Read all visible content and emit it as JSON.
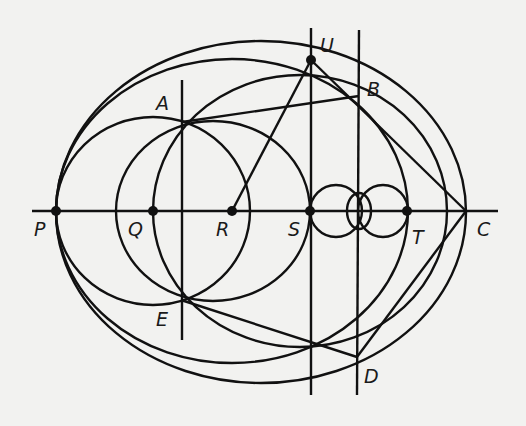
{
  "diagram": {
    "stroke_color": "#111111",
    "background": "#f2f2f0",
    "points": [
      {
        "id": "P",
        "label": "P",
        "x": 56,
        "y": 211,
        "lx": 34,
        "ly": 236,
        "dot": true
      },
      {
        "id": "Q",
        "label": "Q",
        "x": 153,
        "y": 211,
        "lx": 128,
        "ly": 236,
        "dot": true
      },
      {
        "id": "R",
        "label": "R",
        "x": 232,
        "y": 211,
        "lx": 216,
        "ly": 236,
        "dot": true
      },
      {
        "id": "S",
        "label": "S",
        "x": 310,
        "y": 211,
        "lx": 288,
        "ly": 236,
        "dot": true
      },
      {
        "id": "T",
        "label": "T",
        "x": 407,
        "y": 211,
        "lx": 412,
        "ly": 244,
        "dot": true
      },
      {
        "id": "C",
        "label": "C",
        "x": 466,
        "y": 211,
        "lx": 477,
        "ly": 236,
        "dot": false
      },
      {
        "id": "A",
        "label": "A",
        "x": 182,
        "y": 122,
        "lx": 156,
        "ly": 110,
        "dot": false
      },
      {
        "id": "E",
        "label": "E",
        "x": 181,
        "y": 300,
        "lx": 156,
        "ly": 326,
        "dot": false
      },
      {
        "id": "U",
        "label": "U",
        "x": 311,
        "y": 60,
        "lx": 320,
        "ly": 52,
        "dot": true
      },
      {
        "id": "B",
        "label": "B",
        "x": 359,
        "y": 96,
        "lx": 367,
        "ly": 96,
        "dot": false
      },
      {
        "id": "D",
        "label": "D",
        "x": 357,
        "y": 357,
        "lx": 364,
        "ly": 383,
        "dot": false
      }
    ],
    "circles": [
      {
        "name": "outer-circle",
        "cx": 261,
        "cy": 212,
        "rx": 205,
        "ry": 171
      },
      {
        "name": "circle-center-r",
        "cx": 232,
        "cy": 211,
        "rx": 176,
        "ry": 152
      },
      {
        "name": "circle-center-q",
        "cx": 153,
        "cy": 211,
        "rx": 97,
        "ry": 94
      },
      {
        "name": "circle-through-a-e-s",
        "cx": 213,
        "cy": 211,
        "rx": 97,
        "ry": 90
      },
      {
        "name": "circle-through-q-a-b",
        "cx": 300,
        "cy": 211,
        "rx": 147,
        "ry": 136
      },
      {
        "name": "small-circle-left",
        "cx": 336,
        "cy": 211,
        "rx": 26,
        "ry": 26
      },
      {
        "name": "small-circle-right",
        "cx": 383,
        "cy": 211,
        "rx": 25,
        "ry": 26
      },
      {
        "name": "small-ellipse-center",
        "cx": 359,
        "cy": 211,
        "rx": 12,
        "ry": 18
      }
    ],
    "lines": [
      {
        "name": "axis-line",
        "x1": 32,
        "y1": 211,
        "x2": 498,
        "y2": 211
      },
      {
        "name": "vertical-line-a-e",
        "x1": 182,
        "y1": 80,
        "x2": 182,
        "y2": 340
      },
      {
        "name": "vertical-line-s-u",
        "x1": 311,
        "y1": 28,
        "x2": 311,
        "y2": 395
      },
      {
        "name": "vertical-line-b-d",
        "x1": 359,
        "y1": 30,
        "x2": 357,
        "y2": 395
      },
      {
        "name": "segment-r-u",
        "x1": 232,
        "y1": 211,
        "x2": 311,
        "y2": 60
      },
      {
        "name": "segment-a-b",
        "x1": 182,
        "y1": 122,
        "x2": 359,
        "y2": 96
      },
      {
        "name": "segment-u-c",
        "x1": 311,
        "y1": 60,
        "x2": 466,
        "y2": 211
      },
      {
        "name": "segment-c-d",
        "x1": 466,
        "y1": 211,
        "x2": 357,
        "y2": 357
      },
      {
        "name": "segment-e-d",
        "x1": 181,
        "y1": 300,
        "x2": 357,
        "y2": 357
      }
    ]
  }
}
